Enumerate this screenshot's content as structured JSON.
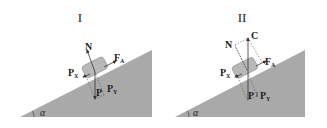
{
  "diagrams": [
    {
      "id": "I",
      "title": "I",
      "labels": {
        "normal": "N",
        "friction": "F",
        "friction_sub": "A",
        "weight": "P",
        "weight_x": "P",
        "weight_x_sub": "X",
        "weight_y": "P",
        "weight_y_sub": "Y",
        "angle": "α"
      }
    },
    {
      "id": "II",
      "title": "II",
      "labels": {
        "point_c": "C",
        "normal": "N",
        "friction": "F",
        "friction_sub": "A",
        "weight": "P",
        "weight_x": "P",
        "weight_x_sub": "X",
        "weight_y": "P",
        "weight_y_sub": "Y",
        "angle": "α"
      }
    }
  ],
  "colors": {
    "incline": "#a9a9a9",
    "block": "#b5b5b5",
    "lines": "#333333",
    "dashed": "#555555"
  }
}
